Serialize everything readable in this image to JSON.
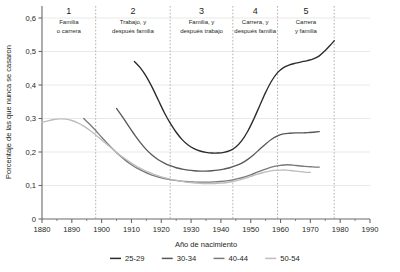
{
  "chart_data": {
    "type": "line",
    "title": "",
    "xlabel": "Año de nacimiento",
    "ylabel": "Porcentaje de las que nunca se casaron",
    "xlim": [
      1880,
      1990
    ],
    "ylim": [
      0,
      0.6
    ],
    "grid": true,
    "xticks": [
      1880,
      1890,
      1900,
      1910,
      1920,
      1930,
      1940,
      1950,
      1960,
      1970,
      1980,
      1990
    ],
    "xtick_labels": [
      "1880",
      "1890",
      "1900",
      "1910",
      "1920",
      "1930",
      "1940",
      "1950",
      "1960",
      "1970",
      "1980",
      "1990"
    ],
    "yticks": [
      0,
      0.1,
      0.2,
      0.3,
      0.4,
      0.5,
      0.6
    ],
    "ytick_labels": [
      "0",
      "0,1",
      "0,2",
      "0,3",
      "0,4",
      "0,5",
      "0,6"
    ],
    "legend_position": "bottom",
    "series": [
      {
        "name": "25-29",
        "color": "#2b2b2b",
        "points": [
          [
            1911,
            0.47
          ],
          [
            1913,
            0.451
          ],
          [
            1915,
            0.425
          ],
          [
            1917,
            0.392
          ],
          [
            1919,
            0.355
          ],
          [
            1921,
            0.318
          ],
          [
            1923,
            0.286
          ],
          [
            1925,
            0.259
          ],
          [
            1927,
            0.237
          ],
          [
            1929,
            0.221
          ],
          [
            1931,
            0.21
          ],
          [
            1933,
            0.203
          ],
          [
            1935,
            0.199
          ],
          [
            1937,
            0.197
          ],
          [
            1939,
            0.197
          ],
          [
            1941,
            0.199
          ],
          [
            1943,
            0.204
          ],
          [
            1945,
            0.215
          ],
          [
            1947,
            0.234
          ],
          [
            1949,
            0.262
          ],
          [
            1951,
            0.298
          ],
          [
            1953,
            0.338
          ],
          [
            1955,
            0.378
          ],
          [
            1957,
            0.412
          ],
          [
            1959,
            0.437
          ],
          [
            1961,
            0.452
          ],
          [
            1963,
            0.46
          ],
          [
            1965,
            0.465
          ],
          [
            1967,
            0.469
          ],
          [
            1969,
            0.473
          ],
          [
            1971,
            0.478
          ],
          [
            1973,
            0.487
          ],
          [
            1975,
            0.503
          ],
          [
            1977,
            0.522
          ],
          [
            1978,
            0.532
          ]
        ]
      },
      {
        "name": "30-34",
        "color": "#595959",
        "points": [
          [
            1905,
            0.33
          ],
          [
            1907,
            0.305
          ],
          [
            1909,
            0.278
          ],
          [
            1911,
            0.252
          ],
          [
            1913,
            0.228
          ],
          [
            1915,
            0.207
          ],
          [
            1917,
            0.19
          ],
          [
            1919,
            0.177
          ],
          [
            1921,
            0.167
          ],
          [
            1923,
            0.159
          ],
          [
            1925,
            0.153
          ],
          [
            1927,
            0.149
          ],
          [
            1929,
            0.146
          ],
          [
            1931,
            0.144
          ],
          [
            1933,
            0.143
          ],
          [
            1935,
            0.143
          ],
          [
            1937,
            0.144
          ],
          [
            1939,
            0.146
          ],
          [
            1941,
            0.149
          ],
          [
            1943,
            0.153
          ],
          [
            1945,
            0.159
          ],
          [
            1947,
            0.167
          ],
          [
            1949,
            0.178
          ],
          [
            1951,
            0.192
          ],
          [
            1953,
            0.208
          ],
          [
            1955,
            0.224
          ],
          [
            1957,
            0.238
          ],
          [
            1959,
            0.248
          ],
          [
            1961,
            0.254
          ],
          [
            1963,
            0.256
          ],
          [
            1965,
            0.257
          ],
          [
            1967,
            0.257
          ],
          [
            1969,
            0.258
          ],
          [
            1971,
            0.259
          ],
          [
            1973,
            0.261
          ]
        ]
      },
      {
        "name": "40-44",
        "color": "#7a7a7a",
        "points": [
          [
            1894,
            0.3
          ],
          [
            1896,
            0.283
          ],
          [
            1898,
            0.264
          ],
          [
            1900,
            0.244
          ],
          [
            1902,
            0.225
          ],
          [
            1904,
            0.207
          ],
          [
            1906,
            0.19
          ],
          [
            1908,
            0.175
          ],
          [
            1910,
            0.162
          ],
          [
            1912,
            0.151
          ],
          [
            1914,
            0.142
          ],
          [
            1916,
            0.134
          ],
          [
            1918,
            0.128
          ],
          [
            1920,
            0.123
          ],
          [
            1922,
            0.119
          ],
          [
            1924,
            0.116
          ],
          [
            1926,
            0.114
          ],
          [
            1928,
            0.112
          ],
          [
            1930,
            0.111
          ],
          [
            1932,
            0.11
          ],
          [
            1934,
            0.11
          ],
          [
            1936,
            0.11
          ],
          [
            1938,
            0.111
          ],
          [
            1940,
            0.112
          ],
          [
            1942,
            0.114
          ],
          [
            1944,
            0.117
          ],
          [
            1946,
            0.121
          ],
          [
            1948,
            0.126
          ],
          [
            1950,
            0.132
          ],
          [
            1952,
            0.139
          ],
          [
            1954,
            0.146
          ],
          [
            1956,
            0.152
          ],
          [
            1958,
            0.157
          ],
          [
            1960,
            0.16
          ],
          [
            1962,
            0.162
          ],
          [
            1964,
            0.161
          ],
          [
            1966,
            0.159
          ],
          [
            1968,
            0.157
          ],
          [
            1970,
            0.156
          ],
          [
            1972,
            0.155
          ],
          [
            1973,
            0.155
          ]
        ]
      },
      {
        "name": "50-54",
        "color": "#bdbdbd",
        "points": [
          [
            1880,
            0.288
          ],
          [
            1882,
            0.293
          ],
          [
            1884,
            0.297
          ],
          [
            1886,
            0.299
          ],
          [
            1888,
            0.298
          ],
          [
            1890,
            0.294
          ],
          [
            1892,
            0.287
          ],
          [
            1894,
            0.277
          ],
          [
            1896,
            0.265
          ],
          [
            1898,
            0.251
          ],
          [
            1900,
            0.236
          ],
          [
            1902,
            0.221
          ],
          [
            1904,
            0.206
          ],
          [
            1906,
            0.192
          ],
          [
            1908,
            0.179
          ],
          [
            1910,
            0.167
          ],
          [
            1912,
            0.156
          ],
          [
            1914,
            0.147
          ],
          [
            1916,
            0.139
          ],
          [
            1918,
            0.132
          ],
          [
            1920,
            0.126
          ],
          [
            1922,
            0.121
          ],
          [
            1924,
            0.117
          ],
          [
            1926,
            0.114
          ],
          [
            1928,
            0.111
          ],
          [
            1930,
            0.109
          ],
          [
            1932,
            0.107
          ],
          [
            1934,
            0.106
          ],
          [
            1936,
            0.106
          ],
          [
            1938,
            0.106
          ],
          [
            1940,
            0.107
          ],
          [
            1942,
            0.109
          ],
          [
            1944,
            0.112
          ],
          [
            1946,
            0.116
          ],
          [
            1948,
            0.121
          ],
          [
            1950,
            0.127
          ],
          [
            1952,
            0.133
          ],
          [
            1954,
            0.138
          ],
          [
            1956,
            0.142
          ],
          [
            1958,
            0.145
          ],
          [
            1960,
            0.146
          ],
          [
            1962,
            0.146
          ],
          [
            1964,
            0.144
          ],
          [
            1966,
            0.142
          ],
          [
            1968,
            0.14
          ],
          [
            1970,
            0.139
          ]
        ]
      }
    ],
    "phases": [
      {
        "number": "1",
        "line1": "Familia",
        "line2": "o carrera",
        "start": 1880,
        "end": 1898
      },
      {
        "number": "2",
        "line1": "Trabajo, y",
        "line2": "después familia",
        "start": 1898,
        "end": 1923
      },
      {
        "number": "3",
        "line1": "Familia, y",
        "line2": "después trabajo",
        "start": 1923,
        "end": 1944
      },
      {
        "number": "4",
        "line1": "Carrera, y",
        "line2": "después familia",
        "start": 1944,
        "end": 1959
      },
      {
        "number": "5",
        "line1": "Carrera",
        "line2": "y familia",
        "start": 1959,
        "end": 1978
      }
    ],
    "phase_dividers": [
      1898,
      1923,
      1944,
      1959,
      1978
    ],
    "legend": [
      {
        "label": "25-29",
        "color": "#2b2b2b"
      },
      {
        "label": "30-34",
        "color": "#595959"
      },
      {
        "label": "40-44",
        "color": "#7a7a7a"
      },
      {
        "label": "50-54",
        "color": "#bdbdbd"
      }
    ]
  },
  "colors": {
    "axis": "#6b6b6b",
    "grid": "#e3e3e3",
    "divider": "#b0a8a0",
    "text": "#231f20"
  }
}
